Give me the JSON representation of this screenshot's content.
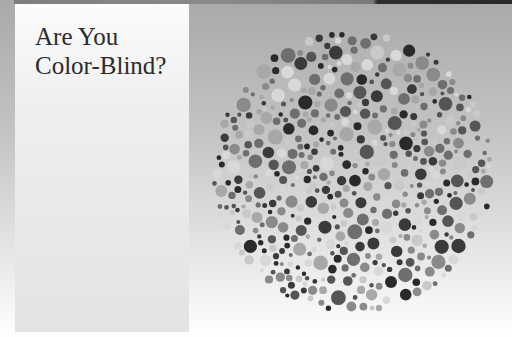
{
  "title_lines": [
    "Are You",
    "Color-Blind?"
  ],
  "plate": {
    "center_x": 352,
    "center_y": 172,
    "radius": 142,
    "dot_count": 720,
    "palette": [
      "#3a3a3a",
      "#555555",
      "#6e6e6e",
      "#8a8a8a",
      "#a8a8a8",
      "#c9c9c9",
      "#d8d8d8",
      "#2a2a2a"
    ]
  }
}
